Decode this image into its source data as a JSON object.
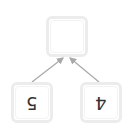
{
  "diagram": {
    "type": "tree",
    "orientation": "rotated-180-labels",
    "nodes": [
      {
        "id": "root",
        "label": ""
      },
      {
        "id": "left",
        "label": "5"
      },
      {
        "id": "right",
        "label": "4"
      }
    ],
    "edges": [
      {
        "from": "left",
        "to": "root"
      },
      {
        "from": "right",
        "to": "root"
      }
    ],
    "colors": {
      "node_border": "#ececec",
      "edge": "#a8a8a8",
      "label": "#333333"
    }
  }
}
